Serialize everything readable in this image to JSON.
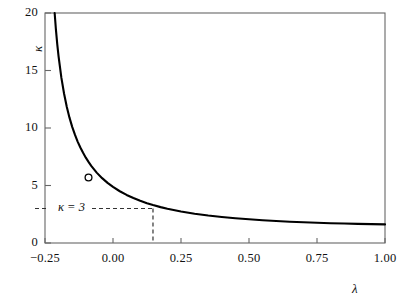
{
  "chart_data": {
    "type": "line",
    "title": "",
    "xlabel": "λ",
    "ylabel": "κ",
    "xlim": [
      -0.25,
      1.0
    ],
    "ylim": [
      0,
      20
    ],
    "grid": false,
    "legend": null,
    "xticks": [
      -0.25,
      0.0,
      0.25,
      0.5,
      0.75,
      1.0
    ],
    "xtick_labels": [
      "−0.25",
      "0.00",
      "0.25",
      "0.50",
      "0.75",
      "1.00"
    ],
    "yticks": [
      0,
      5,
      10,
      15,
      20
    ],
    "ytick_labels": [
      "0",
      "5",
      "10",
      "15",
      "20"
    ],
    "series": [
      {
        "name": "kappa(lambda)",
        "color": "#000000",
        "x": [
          -0.2145,
          -0.21,
          -0.205,
          -0.2,
          -0.19,
          -0.18,
          -0.17,
          -0.16,
          -0.15,
          -0.14,
          -0.13,
          -0.12,
          -0.11,
          -0.1,
          -0.09,
          -0.08,
          -0.06,
          -0.04,
          -0.02,
          0.0,
          0.025,
          0.05,
          0.075,
          0.1,
          0.125,
          0.147,
          0.175,
          0.2,
          0.25,
          0.3,
          0.35,
          0.4,
          0.45,
          0.5,
          0.55,
          0.6,
          0.65,
          0.7,
          0.75,
          0.8,
          0.85,
          0.9,
          0.95,
          1.0
        ],
        "y": [
          20.0,
          18.6,
          17.3,
          16.2,
          14.4,
          13.0,
          11.85,
          10.9,
          10.1,
          9.42,
          8.82,
          8.3,
          7.84,
          7.42,
          7.05,
          6.71,
          6.12,
          5.64,
          5.23,
          4.88,
          4.5,
          4.18,
          3.91,
          3.67,
          3.46,
          3.3,
          3.12,
          2.98,
          2.74,
          2.55,
          2.39,
          2.26,
          2.15,
          2.06,
          1.98,
          1.91,
          1.85,
          1.8,
          1.76,
          1.72,
          1.69,
          1.66,
          1.64,
          1.62
        ]
      }
    ],
    "markers": [
      {
        "name": "open-circle-marker",
        "x": -0.09,
        "y": 5.7,
        "style": "open-circle",
        "edge_color": "#000000",
        "face_color": "#ffffff"
      }
    ],
    "annotations": [
      {
        "name": "kappa-equals-3",
        "text": "κ = 3",
        "value_y": 3,
        "value_x": 0.147,
        "line_style": "dashed",
        "color": "#333333"
      }
    ]
  },
  "axes": {
    "frame_color": "#555555",
    "line_color": "#000000",
    "background": "#ffffff"
  }
}
